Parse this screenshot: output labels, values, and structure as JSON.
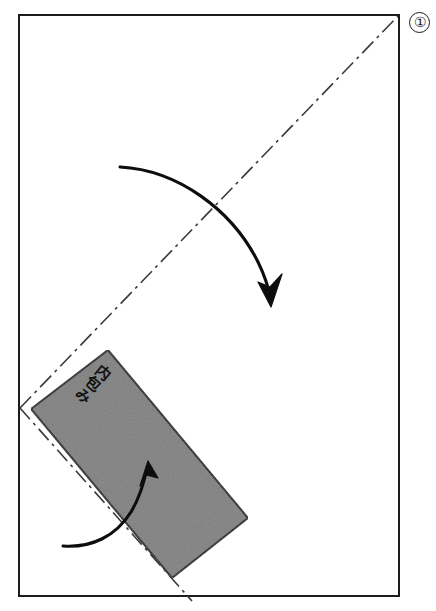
{
  "figure": {
    "kind": "origami-fold-instruction-diagram",
    "step_number": "①",
    "background_color": "#ffffff",
    "frame": {
      "name": "paper-sheet-outline",
      "stroke_color": "#1f1f1f",
      "stroke_width": 2,
      "x": 19,
      "y": 15,
      "width": 380,
      "height": 581
    },
    "fold_lines": [
      {
        "name": "diagonal-fold-crease",
        "style": "dash-dot",
        "stroke_color": "#3a3a3a",
        "x1": 20,
        "y1": 408,
        "x2": 398,
        "y2": 16
      },
      {
        "name": "lower-fold-crease",
        "style": "dash-dot",
        "stroke_color": "#3a3a3a",
        "x1": 20,
        "y1": 408,
        "x2": 192,
        "y2": 600
      }
    ],
    "shaded_panel": {
      "name": "inner-wrap-panel",
      "fill_color": "#808080",
      "stroke_color": "#1f1f1f",
      "stroke_width": 2,
      "corners": [
        [
          108,
          350
        ],
        [
          248,
          518
        ],
        [
          172,
          578
        ],
        [
          31,
          409
        ]
      ]
    },
    "arrows": [
      {
        "name": "upper-fold-arrow",
        "stroke_color": "#0d0d0d",
        "start": [
          120,
          167
        ],
        "end": [
          270,
          302
        ],
        "direction": "clockwise-down-right"
      },
      {
        "name": "lower-fold-arrow",
        "stroke_color": "#0d0d0d",
        "start": [
          63,
          546
        ],
        "end": [
          149,
          463
        ],
        "direction": "counterclockwise-up-right"
      }
    ],
    "labels": [
      {
        "name": "inner-wrap-label",
        "text": "内包み",
        "orientation": "vertical",
        "x": 92,
        "y": 362,
        "rotation": 40,
        "color": "#111111"
      }
    ]
  }
}
